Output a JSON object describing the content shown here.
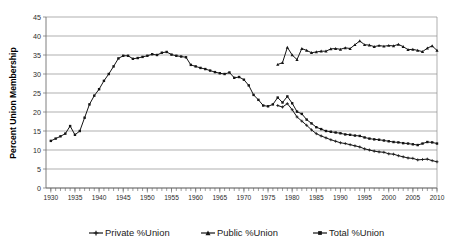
{
  "chart_data": {
    "type": "line",
    "title": "",
    "xlabel": "",
    "ylabel": "Percent Union Membership",
    "xlim": [
      1929,
      2010
    ],
    "ylim": [
      0,
      45
    ],
    "ytick_step": 5,
    "xtick_step": 5,
    "grid": true,
    "minor_xticks": "every year",
    "legend_position": "bottom",
    "yticks": [
      "0",
      "5",
      "10",
      "15",
      "20",
      "25",
      "30",
      "35",
      "40",
      "45"
    ],
    "xticks": [
      "1930",
      "1935",
      "1940",
      "1945",
      "1950",
      "1955",
      "1960",
      "1965",
      "1970",
      "1975",
      "1980",
      "1985",
      "1990",
      "1995",
      "2000",
      "2005",
      "2010"
    ],
    "series": [
      {
        "name": "Private %Union",
        "marker": "cross",
        "color": "#141414",
        "x": [
          1977,
          1978,
          1979,
          1980,
          1981,
          1982,
          1983,
          1984,
          1985,
          1986,
          1987,
          1988,
          1989,
          1990,
          1991,
          1992,
          1993,
          1994,
          1995,
          1996,
          1997,
          1998,
          1999,
          2000,
          2001,
          2002,
          2003,
          2004,
          2005,
          2006,
          2007,
          2008,
          2009,
          2010
        ],
        "values": [
          21.7,
          21.3,
          22.2,
          20.6,
          18.7,
          17.6,
          16.5,
          15.3,
          14.3,
          13.7,
          13.2,
          12.7,
          12.3,
          11.9,
          11.7,
          11.4,
          11.1,
          10.8,
          10.3,
          10.0,
          9.7,
          9.5,
          9.4,
          9.0,
          8.9,
          8.5,
          8.2,
          7.9,
          7.8,
          7.4,
          7.5,
          7.6,
          7.2,
          6.9
        ]
      },
      {
        "name": "Public %Union",
        "marker": "triangle",
        "color": "#141414",
        "x": [
          1977,
          1978,
          1979,
          1980,
          1981,
          1982,
          1983,
          1984,
          1985,
          1986,
          1987,
          1988,
          1989,
          1990,
          1991,
          1992,
          1993,
          1994,
          1995,
          1996,
          1997,
          1998,
          1999,
          2000,
          2001,
          2002,
          2003,
          2004,
          2005,
          2006,
          2007,
          2008,
          2009,
          2010
        ],
        "values": [
          32.5,
          33.0,
          37.0,
          35.0,
          33.8,
          36.7,
          36.2,
          35.6,
          35.8,
          36.0,
          36.0,
          36.6,
          36.7,
          36.5,
          36.9,
          36.7,
          37.7,
          38.7,
          37.7,
          37.6,
          37.2,
          37.5,
          37.3,
          37.5,
          37.4,
          37.8,
          37.2,
          36.4,
          36.5,
          36.2,
          35.9,
          36.8,
          37.4,
          36.2
        ]
      },
      {
        "name": "Total %Union",
        "marker": "square",
        "color": "#141414",
        "x": [
          1930,
          1931,
          1932,
          1933,
          1934,
          1935,
          1936,
          1937,
          1938,
          1939,
          1940,
          1941,
          1942,
          1943,
          1944,
          1945,
          1946,
          1947,
          1948,
          1949,
          1950,
          1951,
          1952,
          1953,
          1954,
          1955,
          1956,
          1957,
          1958,
          1959,
          1960,
          1961,
          1962,
          1963,
          1964,
          1965,
          1966,
          1967,
          1968,
          1969,
          1970,
          1971,
          1972,
          1973,
          1974,
          1975,
          1976,
          1977,
          1978,
          1979,
          1980,
          1981,
          1982,
          1983,
          1984,
          1985,
          1986,
          1987,
          1988,
          1989,
          1990,
          1991,
          1992,
          1993,
          1994,
          1995,
          1996,
          1997,
          1998,
          1999,
          2000,
          2001,
          2002,
          2003,
          2004,
          2005,
          2006,
          2007,
          2008,
          2009,
          2010
        ],
        "values": [
          12.4,
          13.0,
          13.6,
          14.3,
          16.3,
          14.0,
          15.0,
          18.5,
          22.0,
          24.3,
          26.0,
          28.2,
          30.0,
          32.0,
          34.1,
          34.8,
          34.8,
          34.0,
          34.2,
          34.5,
          34.8,
          35.2,
          35.0,
          35.6,
          35.8,
          35.1,
          34.8,
          34.6,
          34.4,
          32.4,
          32.0,
          31.6,
          31.3,
          30.9,
          30.5,
          30.2,
          30.0,
          30.4,
          29.0,
          29.2,
          28.5,
          27.0,
          24.5,
          23.2,
          21.7,
          21.5,
          22.0,
          23.8,
          22.5,
          24.1,
          22.3,
          20.1,
          19.5,
          18.0,
          17.0,
          16.0,
          15.5,
          15.0,
          14.8,
          14.6,
          14.4,
          14.1,
          14.0,
          13.8,
          13.7,
          13.3,
          13.0,
          12.8,
          12.7,
          12.5,
          12.3,
          12.1,
          12.0,
          11.8,
          11.7,
          11.5,
          11.3,
          11.7,
          12.1,
          12.0,
          11.7
        ]
      }
    ],
    "legend": [
      {
        "label": "Private %Union",
        "marker": "cross"
      },
      {
        "label": "Public %Union",
        "marker": "triangle"
      },
      {
        "label": "Total %Union",
        "marker": "square"
      }
    ]
  }
}
